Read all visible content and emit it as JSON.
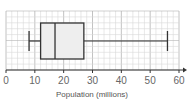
{
  "chart_data": {
    "type": "boxplot",
    "title": "",
    "xlabel": "Population (millions)",
    "ylabel": "",
    "xlim": [
      0,
      60
    ],
    "xticks": [
      0,
      10,
      20,
      30,
      40,
      50,
      60
    ],
    "xtick_labels": [
      "0",
      "10",
      "20",
      "30",
      "40",
      "50",
      "60"
    ],
    "grid": true,
    "minor_grid_step": 2,
    "orientation": "horizontal",
    "box": {
      "min": 8,
      "q1": 12,
      "median": 17,
      "q3": 27,
      "max": 56
    }
  },
  "colors": {
    "grid_minor": "#d9d9d9",
    "grid_major": "#b3b3b3",
    "box_fill": "#eeeeee",
    "stroke": "#333333",
    "axis": "#333333",
    "text": "#666666"
  }
}
